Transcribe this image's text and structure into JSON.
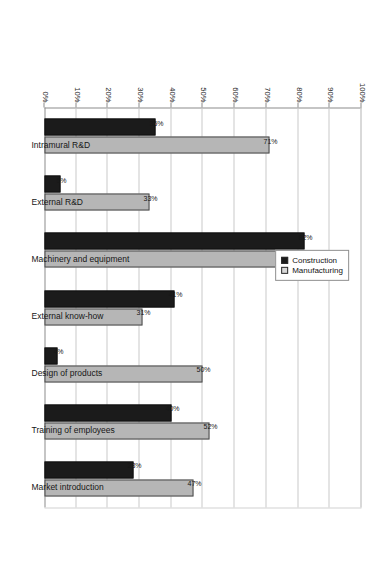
{
  "chart_data": {
    "type": "bar",
    "title": "",
    "subtitle": "",
    "xlabel": "",
    "ylabel": "",
    "ylim": [
      0,
      100
    ],
    "grid": true,
    "orientation": "vertical-columns-rotated-90ccw",
    "legend_position": "inside-upper-right",
    "categories": [
      "Intramural R&D",
      "External R&D",
      "Machinery and equipment",
      "External know-how",
      "Design of products",
      "Training of employees",
      "Market introduction"
    ],
    "tick_labels": [
      "0%",
      "10%",
      "20%",
      "30%",
      "40%",
      "50%",
      "60%",
      "70%",
      "80%",
      "90%",
      "100%"
    ],
    "tick_values": [
      0,
      10,
      20,
      30,
      40,
      50,
      60,
      70,
      80,
      90,
      100
    ],
    "series": [
      {
        "name": "Construction",
        "color": "#1b1b1b",
        "values": [
          35,
          5,
          82,
          41,
          4,
          40,
          28
        ],
        "labels": [
          "35%",
          "5%",
          "82%",
          "41%",
          "4%",
          "40%",
          "28%"
        ]
      },
      {
        "name": "Manufacturing",
        "color": "#b6b6b6",
        "values": [
          71,
          33,
          82,
          31,
          50,
          52,
          47
        ],
        "labels": [
          "71%",
          "33%",
          "82%",
          "31%",
          "50%",
          "52%",
          "47%"
        ]
      }
    ]
  },
  "legend": {
    "items": [
      {
        "label": "Construction",
        "swatch": "construction"
      },
      {
        "label": "Manufacturing",
        "swatch": "manufacturing"
      }
    ]
  }
}
